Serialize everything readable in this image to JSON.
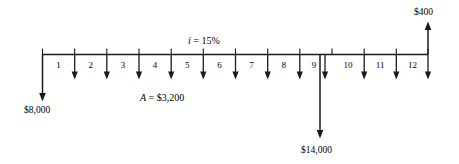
{
  "diagram": {
    "type": "cash-flow-diagram",
    "title": "",
    "interest_label": {
      "symbol": "i",
      "equals": " = ",
      "value": "15%",
      "full_text": "i = 15%"
    },
    "annuity_label": {
      "symbol": "A",
      "equals": " = ",
      "value": "$3,200",
      "full_text": "A = $3,200"
    },
    "timeline": {
      "start_period": 0,
      "end_period": 12,
      "period_labels": [
        "1",
        "2",
        "3",
        "4",
        "5",
        "6",
        "7",
        "8",
        "9",
        "10",
        "11",
        "12"
      ]
    },
    "cash_flows": [
      {
        "name": "initial-investment",
        "label": "$8,000",
        "amount": 8000,
        "period": 0,
        "direction": "down"
      },
      {
        "name": "annuity-series",
        "label": "$3,200",
        "amount": 3200,
        "periods": [
          1,
          2,
          3,
          4,
          5,
          6,
          7,
          8,
          9,
          10,
          11,
          12
        ],
        "direction": "down"
      },
      {
        "name": "large-outflow",
        "label": "$14,000",
        "amount": 14000,
        "period": 9,
        "direction": "down"
      },
      {
        "name": "salvage-inflow",
        "label": "$400",
        "amount": 400,
        "period": 12,
        "direction": "up"
      }
    ],
    "colors": {
      "ink": "#1a1a1a",
      "background": "#ffffff"
    }
  }
}
